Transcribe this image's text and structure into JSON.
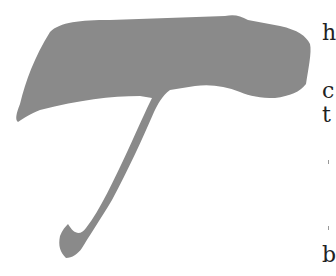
{
  "page": {
    "background": "#ffffff"
  },
  "dropcap": {
    "letter": "T",
    "color": "#8a8a8a",
    "style": "brush-stroke ornamental initial"
  },
  "edge_text": {
    "letters": [
      {
        "char": "h",
        "top": 22
      },
      {
        "char": "c",
        "top": 80
      },
      {
        "char": "t",
        "top": 104
      },
      {
        "char": "b",
        "top": 244
      }
    ],
    "color": "#222222"
  }
}
